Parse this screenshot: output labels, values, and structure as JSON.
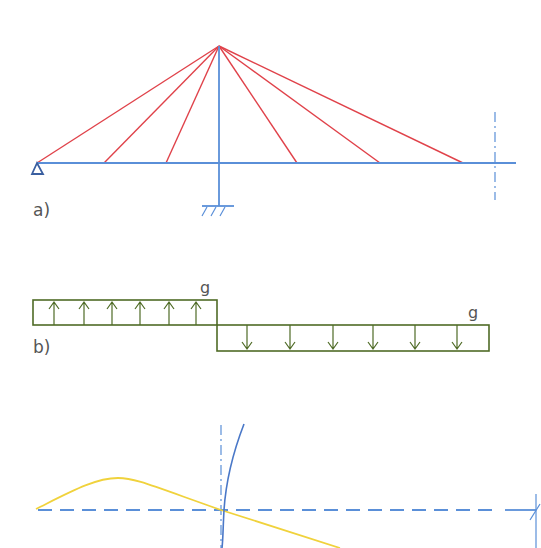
{
  "colors": {
    "structure": "#5a8fd8",
    "cable": "#e0424a",
    "load": "#4f6b26",
    "curve": "#f0d23c",
    "text": "#555555"
  },
  "panel_a": {
    "label": "a)",
    "pylon_top": [
      219,
      46
    ],
    "deck_y": 163,
    "deck_x": [
      37,
      516
    ],
    "cable_anchors_x": [
      37,
      104,
      166,
      297,
      380,
      463
    ],
    "symmetry_axis_x": 495,
    "support_left": "pin-support-triangle",
    "support_pylon": "fixed-support-hatch"
  },
  "panel_b": {
    "label": "b)",
    "load_left": {
      "label": "g",
      "direction": "up",
      "arrows": 6
    },
    "load_right": {
      "label": "g",
      "direction": "down",
      "arrows": 6
    }
  },
  "panel_c": {
    "baseline": "dashed-axis",
    "curves": [
      "yellow-deflection-curve",
      "blue-moment-curve"
    ]
  }
}
